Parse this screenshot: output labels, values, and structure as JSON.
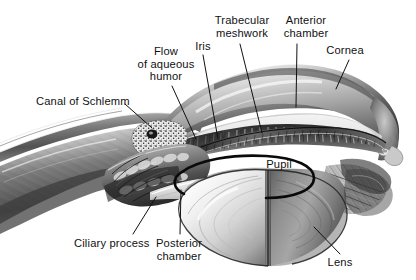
{
  "figure": {
    "style": "grayscale airbrush / stipple medical illustration, cut-away sagittal view",
    "width": 416,
    "height": 280,
    "background_color": "#ffffff",
    "ink_color": "#111111"
  },
  "labels": [
    {
      "id": "canal-of-schlemm",
      "text": "Canal of Schlemm",
      "x": 36,
      "y": 95,
      "align": "left",
      "leader": {
        "x1": 125,
        "y1": 104,
        "x2": 152,
        "y2": 128
      }
    },
    {
      "id": "flow-of-aqueous-humor",
      "text": "Flow\nof aqueous\nhumor",
      "x": 135,
      "y": 45,
      "align": "center",
      "leader": {
        "x1": 172,
        "y1": 86,
        "x2": 196,
        "y2": 139
      }
    },
    {
      "id": "iris",
      "text": "Iris",
      "x": 190,
      "y": 40,
      "align": "center",
      "leader": {
        "x1": 203,
        "y1": 55,
        "x2": 218,
        "y2": 139
      }
    },
    {
      "id": "trabecular-meshwork",
      "text": "Trabecular\nmeshwork",
      "x": 212,
      "y": 14,
      "align": "center",
      "leader": {
        "x1": 240,
        "y1": 44,
        "x2": 262,
        "y2": 133
      }
    },
    {
      "id": "anterior-chamber",
      "text": "Anterior\nchamber",
      "x": 280,
      "y": 14,
      "align": "center",
      "leader": {
        "x1": 297,
        "y1": 44,
        "x2": 296,
        "y2": 107
      }
    },
    {
      "id": "cornea",
      "text": "Cornea",
      "x": 322,
      "y": 44,
      "align": "center",
      "leader": {
        "x1": 349,
        "y1": 60,
        "x2": 336,
        "y2": 89
      }
    },
    {
      "id": "pupil",
      "text": "Pupil",
      "x": 262,
      "y": 158,
      "align": "center",
      "leader": null
    },
    {
      "id": "ciliary-process",
      "text": "Ciliary process",
      "x": 74,
      "y": 237,
      "align": "left",
      "leader": {
        "x1": 133,
        "y1": 234,
        "x2": 156,
        "y2": 197
      }
    },
    {
      "id": "posterior-chamber",
      "text": "Posterior\nchamber",
      "x": 152,
      "y": 237,
      "align": "center",
      "leader": {
        "x1": 180,
        "y1": 234,
        "x2": 181,
        "y2": 190
      }
    },
    {
      "id": "lens",
      "text": "Lens",
      "x": 324,
      "y": 256,
      "align": "center",
      "leader": {
        "x1": 340,
        "y1": 254,
        "x2": 314,
        "y2": 227
      }
    }
  ],
  "structures": [
    {
      "id": "sclera",
      "name": "Sclera"
    },
    {
      "id": "cornea",
      "name": "Cornea"
    },
    {
      "id": "anterior-chamber",
      "name": "Anterior chamber"
    },
    {
      "id": "posterior-chamber",
      "name": "Posterior chamber"
    },
    {
      "id": "iris",
      "name": "Iris"
    },
    {
      "id": "pupil",
      "name": "Pupil"
    },
    {
      "id": "lens",
      "name": "Lens"
    },
    {
      "id": "ciliary-body",
      "name": "Ciliary body and processes"
    },
    {
      "id": "trabecular-meshwork",
      "name": "Trabecular meshwork"
    },
    {
      "id": "canal-of-schlemm",
      "name": "Canal of Schlemm"
    },
    {
      "id": "zonule-fibers",
      "name": "Zonular fibers"
    },
    {
      "id": "aqueous-flow-arrow",
      "name": "Aqueous humor flow arrow"
    }
  ]
}
